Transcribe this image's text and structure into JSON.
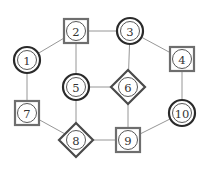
{
  "diagram": {
    "type": "graph",
    "nodes": [
      {
        "id": "1",
        "label": "1",
        "shape": "double-circle",
        "x": 27,
        "y": 60
      },
      {
        "id": "2",
        "label": "2",
        "shape": "square",
        "x": 76,
        "y": 31
      },
      {
        "id": "3",
        "label": "3",
        "shape": "double-circle",
        "x": 130,
        "y": 31
      },
      {
        "id": "4",
        "label": "4",
        "shape": "square",
        "x": 182,
        "y": 59
      },
      {
        "id": "5",
        "label": "5",
        "shape": "double-circle",
        "x": 76,
        "y": 87
      },
      {
        "id": "6",
        "label": "6",
        "shape": "diamond",
        "x": 128,
        "y": 87
      },
      {
        "id": "7",
        "label": "7",
        "shape": "square",
        "x": 27,
        "y": 113
      },
      {
        "id": "8",
        "label": "8",
        "shape": "diamond",
        "x": 76,
        "y": 140
      },
      {
        "id": "9",
        "label": "9",
        "shape": "square",
        "x": 128,
        "y": 140
      },
      {
        "id": "10",
        "label": "10",
        "shape": "double-circle",
        "x": 182,
        "y": 113
      }
    ],
    "edges": [
      [
        "1",
        "2"
      ],
      [
        "2",
        "3"
      ],
      [
        "3",
        "4"
      ],
      [
        "2",
        "5"
      ],
      [
        "3",
        "6"
      ],
      [
        "5",
        "6"
      ],
      [
        "1",
        "7"
      ],
      [
        "7",
        "8"
      ],
      [
        "5",
        "8"
      ],
      [
        "6",
        "9"
      ],
      [
        "8",
        "9"
      ],
      [
        "9",
        "10"
      ],
      [
        "4",
        "10"
      ]
    ]
  }
}
